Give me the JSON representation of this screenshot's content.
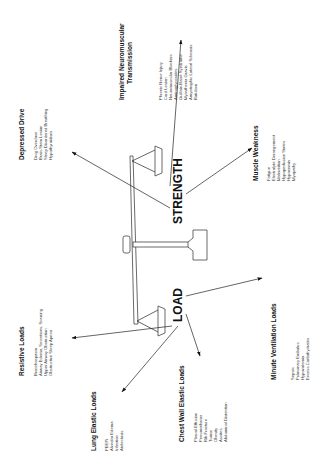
{
  "diagram": {
    "center": {
      "strength_label": "STRENGTH",
      "load_label": "LOAD"
    },
    "strength_factors": [
      {
        "title": "Depressed Drive",
        "items": [
          "Drug Overdose",
          "Brain-Stem Lesion",
          "Sleep Disordered Breathing",
          "Hypothyroidism"
        ]
      },
      {
        "title_line1": "Impaired Neuromuscular",
        "title_line2": "Transmission",
        "items": [
          "Phrenic Nerve Injury",
          "Cord Lesion",
          "Neuromuscular Blockers",
          "Aminoglycosides",
          "Guillain-Barré Syndrome",
          "Myasthenia Gravis",
          "Amyotrophic Lateral Sclerosis",
          "Botulism"
        ]
      },
      {
        "title": "Muscle Weakness",
        "items": [
          "Fatigue",
          "Electrolyte Derangement",
          "Malnutrition",
          "Hypoperfusion States",
          "Hypoxemia",
          "Myopathy"
        ]
      }
    ],
    "load_factors": [
      {
        "title": "Resistive Loads",
        "items": [
          "Bronchospasm",
          "Airway Edema, Secretions, Scarring",
          "Upper Airway Obstruction",
          "Obstructive Sleep Apnea"
        ]
      },
      {
        "title": "Lung Elastic Loads",
        "items": [
          "PEEPi",
          "Alveolar Edema",
          "Infection",
          "Atelectasis"
        ]
      },
      {
        "title": "Chest Wall Elastic Loads",
        "items": [
          "Pleural Effusion",
          "Pneumothorax",
          "Rib Fracture",
          "Tumor",
          "Obesity",
          "Ascites",
          "Abdominal Distention"
        ]
      },
      {
        "title": "Minute Ventilation Loads",
        "items": [
          "Sepsis",
          "Pulmonary Embolus",
          "Hypovolemia",
          "Excess Carbohydrates"
        ]
      }
    ]
  }
}
